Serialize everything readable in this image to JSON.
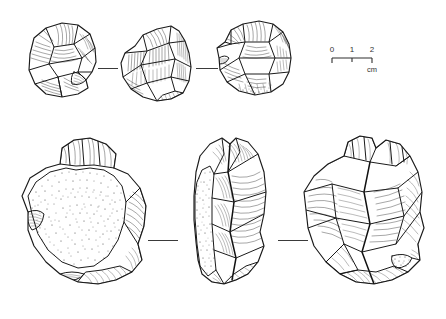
{
  "plate": {
    "kind": "archaeological-lithic-illustration",
    "background_color": "#ffffff",
    "ink_color": "#1a1a1a",
    "width": 446,
    "height": 319
  },
  "scale_bar": {
    "name": "scale-bar",
    "unit_label": "cm",
    "ticks": [
      "0",
      "1",
      "2"
    ],
    "total_units": 2,
    "x": 332,
    "y": 58,
    "length_px": 40
  },
  "artifacts": [
    {
      "id": "top-left",
      "name": "artefact-top-left",
      "row": "top",
      "view": "dorsal",
      "has_cortex_stipple": false,
      "description": "small flake, hatched flake scars"
    },
    {
      "id": "top-middle",
      "name": "artefact-top-middle",
      "row": "top",
      "view": "profile",
      "has_cortex_stipple": false,
      "description": "small flake, vertical ripple hatching"
    },
    {
      "id": "top-right",
      "name": "artefact-top-right",
      "row": "top",
      "view": "ventral",
      "has_cortex_stipple": true,
      "description": "small flake with stippled basal edge"
    },
    {
      "id": "bottom-left",
      "name": "artefact-bottom-left",
      "row": "bottom",
      "view": "dorsal",
      "has_cortex_stipple": true,
      "description": "large core with broad stippled cortex surface"
    },
    {
      "id": "bottom-middle",
      "name": "artefact-bottom-middle",
      "row": "bottom",
      "view": "profile",
      "has_cortex_stipple": true,
      "description": "narrow side profile, stippled cortex strip at left edge"
    },
    {
      "id": "bottom-right",
      "name": "artefact-bottom-right",
      "row": "bottom",
      "view": "ventral",
      "has_cortex_stipple": true,
      "description": "large core, radial flake scars, small stippled patch lower right"
    }
  ],
  "connectors": [
    {
      "name": "alignment-tick-top-left",
      "x": 98,
      "y": 68,
      "width": 20
    },
    {
      "name": "alignment-tick-top-right",
      "x": 196,
      "y": 68,
      "width": 22
    },
    {
      "name": "alignment-tick-bottom-left",
      "x": 148,
      "y": 240,
      "width": 30
    },
    {
      "name": "alignment-tick-bottom-right",
      "x": 278,
      "y": 240,
      "width": 30
    }
  ]
}
